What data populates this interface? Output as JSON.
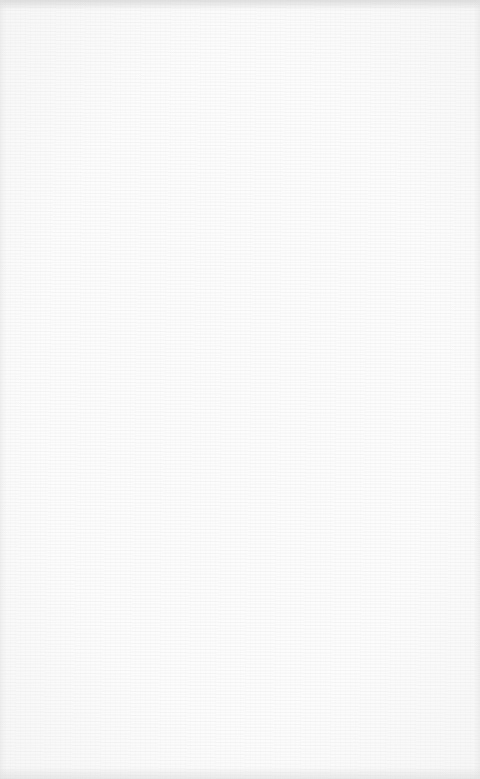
{
  "surface": {
    "description": "Blank white textured surface with no visible text or UI elements",
    "base_color": "#fcfcfc",
    "edge_shade_color": "#d0d0d0"
  }
}
